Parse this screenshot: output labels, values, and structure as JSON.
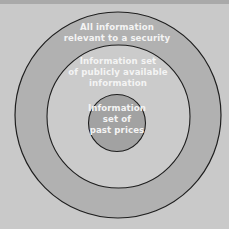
{
  "diagram": {
    "type": "nested-circles",
    "colors": {
      "background": "#c9c9c9",
      "top_strip": "#a9a9a9",
      "outer_ring": "#b1b1b1",
      "middle_circle": "#cbcbcb",
      "inner_circle": "#a2a2a2",
      "stroke": "#1e1e1e",
      "text": "#f4f4f4"
    },
    "circles": [
      {
        "id": "outer",
        "lines": [
          "All information",
          "relevant to a security"
        ]
      },
      {
        "id": "middle",
        "lines": [
          "Information set",
          "of publicly available",
          "information"
        ]
      },
      {
        "id": "inner",
        "lines": [
          "Information",
          "set of",
          "past prices"
        ]
      }
    ]
  }
}
